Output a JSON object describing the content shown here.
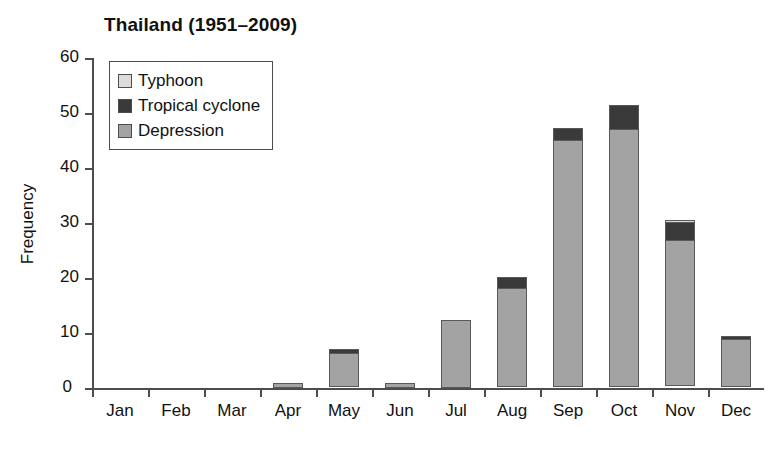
{
  "chart_data": {
    "type": "bar",
    "stacked": true,
    "title": "Thailand (1951–2009)",
    "xlabel": "",
    "ylabel": "Frequency",
    "categories": [
      "Jan",
      "Feb",
      "Mar",
      "Apr",
      "May",
      "Jun",
      "Jul",
      "Aug",
      "Sep",
      "Oct",
      "Nov",
      "Dec"
    ],
    "series": [
      {
        "name": "Depression",
        "color": "#a3a3a3",
        "values": [
          0,
          0,
          0,
          1.0,
          6.1,
          1.0,
          12.3,
          18.0,
          45.0,
          47.0,
          26.5,
          8.8
        ]
      },
      {
        "name": "Tropical cyclone",
        "color": "#3a3a3a",
        "values": [
          0,
          0,
          0,
          0,
          1.0,
          0,
          0,
          2.2,
          2.3,
          4.5,
          3.5,
          0.7
        ]
      },
      {
        "name": "Typhoon",
        "color": "#dcdcdc",
        "values": [
          0,
          0,
          0,
          0,
          0,
          0,
          0,
          0,
          0,
          0,
          0.6,
          0
        ]
      }
    ],
    "totals": [
      0,
      0,
      0,
      1.0,
      7.1,
      1.0,
      12.3,
      20.2,
      47.3,
      51.5,
      30.6,
      9.5
    ],
    "ylim": [
      0,
      60
    ],
    "yticks": [
      0,
      10,
      20,
      30,
      40,
      50,
      60
    ],
    "ytick_labels": [
      "0",
      "10",
      "20",
      "30",
      "40",
      "50",
      "60"
    ],
    "grid": false,
    "legend_position": "top-left",
    "legend_order": [
      "Typhoon",
      "Tropical cyclone",
      "Depression"
    ]
  },
  "legend": {
    "items": [
      {
        "label": "Typhoon",
        "color": "#dcdcdc"
      },
      {
        "label": "Tropical cyclone",
        "color": "#3a3a3a"
      },
      {
        "label": "Depression",
        "color": "#a3a3a3"
      }
    ]
  },
  "colors": {
    "axis": "#4d4d4d",
    "bar_outline": "#595959",
    "text": "#111111",
    "background": "#ffffff"
  }
}
